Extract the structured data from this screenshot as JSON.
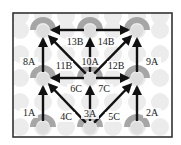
{
  "diagram": {
    "frame": {
      "x": 13,
      "y": 13,
      "width": 159,
      "height": 124,
      "stroke": "#333333"
    },
    "colors": {
      "arc": "#a6a6a6",
      "node_center": "#dedede",
      "background_dots": "#ececec",
      "arrow": "#111111",
      "label": "#222222"
    },
    "nodes": [
      {
        "id": "top-left",
        "x": 43,
        "y": 30
      },
      {
        "id": "top-center",
        "x": 90,
        "y": 30
      },
      {
        "id": "top-right",
        "x": 137,
        "y": 30
      },
      {
        "id": "mid-left",
        "x": 43,
        "y": 78
      },
      {
        "id": "mid-center",
        "x": 90,
        "y": 78
      },
      {
        "id": "mid-right",
        "x": 137,
        "y": 78
      },
      {
        "id": "bottom-left",
        "x": 43,
        "y": 127
      },
      {
        "id": "bottom-center",
        "x": 90,
        "y": 127
      },
      {
        "id": "bottom-right",
        "x": 137,
        "y": 127
      }
    ],
    "edges": [
      {
        "label": "1A",
        "from": "bottom-left",
        "to": "mid-left",
        "lx": 29,
        "ly": 116
      },
      {
        "label": "2A",
        "from": "bottom-right",
        "to": "mid-right",
        "lx": 152,
        "ly": 116
      },
      {
        "label": "3A",
        "from": "bottom-center",
        "to": "mid-center",
        "lx": 90,
        "ly": 117
      },
      {
        "label": "4C",
        "from": "bottom-center",
        "to": "mid-left",
        "lx": 66,
        "ly": 120
      },
      {
        "label": "5C",
        "from": "bottom-center",
        "to": "mid-right",
        "lx": 114,
        "ly": 120
      },
      {
        "label": "6C",
        "from": "mid-center",
        "to": "mid-left",
        "lx": 76,
        "ly": 92
      },
      {
        "label": "7C",
        "from": "mid-center",
        "to": "mid-right",
        "lx": 104,
        "ly": 92
      },
      {
        "label": "8A",
        "from": "mid-left",
        "to": "top-left",
        "lx": 29,
        "ly": 65
      },
      {
        "label": "9A",
        "from": "mid-right",
        "to": "top-right",
        "lx": 152,
        "ly": 65
      },
      {
        "label": "10A",
        "from": "mid-center",
        "to": "top-center",
        "lx": 90,
        "ly": 65
      },
      {
        "label": "11B",
        "from": "mid-center",
        "to": "top-left",
        "lx": 64,
        "ly": 69
      },
      {
        "label": "12B",
        "from": "mid-center",
        "to": "top-right",
        "lx": 116,
        "ly": 69
      },
      {
        "label": "13B",
        "from": "top-center",
        "to": "top-left",
        "lx": 75,
        "ly": 45
      },
      {
        "label": "14B",
        "from": "top-center",
        "to": "top-right",
        "lx": 106,
        "ly": 45
      }
    ]
  }
}
